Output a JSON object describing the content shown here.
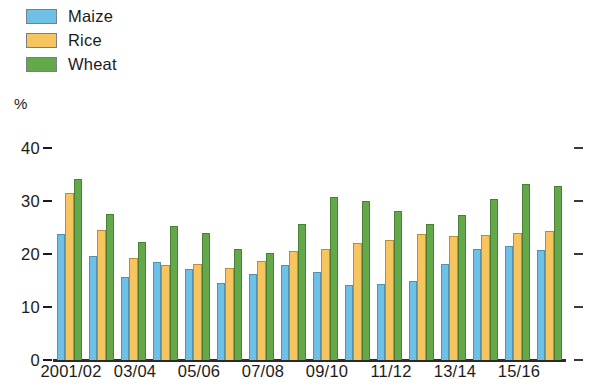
{
  "chart_data": {
    "type": "bar",
    "title": "",
    "subtitle": "",
    "xlabel": "",
    "ylabel": "%",
    "ylim": [
      0,
      40
    ],
    "yticks": [
      0,
      10,
      20,
      30,
      40
    ],
    "ytick_labels": [
      "0",
      "10",
      "20",
      "30",
      "40"
    ],
    "grid": false,
    "legend_position": "top-left",
    "right_axis_ticks": true,
    "categories": [
      "2001/02",
      "02/03",
      "03/04",
      "04/05",
      "05/06",
      "06/07",
      "07/08",
      "08/09",
      "09/10",
      "10/11",
      "11/12",
      "12/13",
      "13/14",
      "14/15",
      "15/16",
      "16/17"
    ],
    "visible_tick_labels": [
      "2001/02",
      "03/04",
      "05/06",
      "07/08",
      "09/10",
      "11/12",
      "13/14",
      "15/16"
    ],
    "visible_tick_indices": [
      0,
      2,
      4,
      6,
      8,
      10,
      12,
      14
    ],
    "series": [
      {
        "name": "Maize",
        "color": "#6ec0e6",
        "values": [
          23.8,
          19.7,
          15.7,
          18.5,
          17.2,
          14.6,
          16.2,
          17.9,
          16.7,
          14.2,
          14.4,
          15.0,
          18.1,
          20.9,
          21.5,
          20.7
        ]
      },
      {
        "name": "Rice",
        "color": "#f7c55f",
        "values": [
          31.6,
          24.5,
          19.2,
          17.9,
          18.2,
          17.4,
          18.6,
          20.6,
          21.0,
          22.0,
          22.7,
          23.8,
          23.4,
          23.6,
          24.0,
          24.3
        ]
      },
      {
        "name": "Wheat",
        "color": "#63a94a",
        "values": [
          34.2,
          27.5,
          22.3,
          25.2,
          24.0,
          21.0,
          20.1,
          25.7,
          30.8,
          30.0,
          28.2,
          25.7,
          27.3,
          30.3,
          33.2,
          32.9
        ]
      }
    ]
  },
  "legend": {
    "items": [
      {
        "label": "Maize",
        "color": "#6ec0e6"
      },
      {
        "label": "Rice",
        "color": "#f7c55f"
      },
      {
        "label": "Wheat",
        "color": "#63a94a"
      }
    ]
  },
  "axis": {
    "unit_label": "%"
  }
}
